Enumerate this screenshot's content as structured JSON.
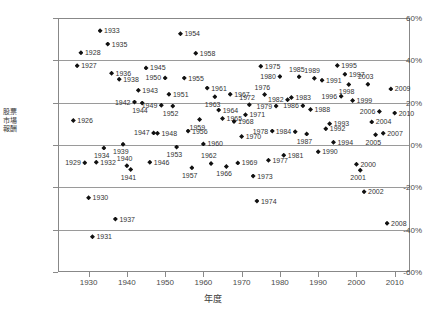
{
  "chart_data": {
    "type": "scatter",
    "title": "",
    "xlabel": "年度",
    "ylabel": "股票市場報酬",
    "xlim": [
      1922,
      2014
    ],
    "ylim": [
      -60,
      60
    ],
    "grid": true,
    "legend": "none",
    "xticks": [
      "1930",
      "1940",
      "1950",
      "1960",
      "1970",
      "1980",
      "1990",
      "2000",
      "2010"
    ],
    "xtick_values": [
      1930,
      1940,
      1950,
      1960,
      1970,
      1980,
      1990,
      2000,
      2010
    ],
    "yticks": [
      "60%",
      "40%",
      "20%",
      "0%",
      "-20%",
      "-40%",
      "-60%"
    ],
    "ytick_values": [
      60,
      40,
      20,
      0,
      -20,
      -40,
      -60
    ],
    "points": [
      {
        "label": "1926",
        "x": 1926,
        "y": 11.6,
        "pos": "r"
      },
      {
        "label": "1927",
        "x": 1927,
        "y": 37.5,
        "pos": "r"
      },
      {
        "label": "1928",
        "x": 1928,
        "y": 43.6,
        "pos": "r"
      },
      {
        "label": "1929",
        "x": 1929,
        "y": -8.4,
        "pos": "l"
      },
      {
        "label": "1930",
        "x": 1930,
        "y": -24.9,
        "pos": "r"
      },
      {
        "label": "1931",
        "x": 1931,
        "y": -43.3,
        "pos": "r"
      },
      {
        "label": "1932",
        "x": 1932,
        "y": -8.2,
        "pos": "r"
      },
      {
        "label": "1933",
        "x": 1933,
        "y": 54.0,
        "pos": "r"
      },
      {
        "label": "1934",
        "x": 1934,
        "y": -1.4,
        "pos": "b"
      },
      {
        "label": "1935",
        "x": 1935,
        "y": 47.7,
        "pos": "r"
      },
      {
        "label": "1936",
        "x": 1936,
        "y": 33.9,
        "pos": "r"
      },
      {
        "label": "1937",
        "x": 1937,
        "y": -35.0,
        "pos": "r"
      },
      {
        "label": "1938",
        "x": 1938,
        "y": 31.1,
        "pos": "r"
      },
      {
        "label": "1939",
        "x": 1939,
        "y": 0.4,
        "pos": "b"
      },
      {
        "label": "1940",
        "x": 1940,
        "y": -9.8,
        "pos": "t"
      },
      {
        "label": "1941",
        "x": 1941,
        "y": -11.6,
        "pos": "b"
      },
      {
        "label": "1942",
        "x": 1942,
        "y": 20.3,
        "pos": "l"
      },
      {
        "label": "1943",
        "x": 1943,
        "y": 25.9,
        "pos": "r"
      },
      {
        "label": "1944",
        "x": 1944,
        "y": 19.8,
        "pos": "b"
      },
      {
        "label": "1945",
        "x": 1945,
        "y": 36.4,
        "pos": "r"
      },
      {
        "label": "1946",
        "x": 1946,
        "y": -8.1,
        "pos": "r"
      },
      {
        "label": "1947",
        "x": 1947,
        "y": 5.7,
        "pos": "l"
      },
      {
        "label": "1948",
        "x": 1948,
        "y": 5.5,
        "pos": "r"
      },
      {
        "label": "1949",
        "x": 1949,
        "y": 18.8,
        "pos": "l"
      },
      {
        "label": "1950",
        "x": 1950,
        "y": 31.7,
        "pos": "l"
      },
      {
        "label": "1951",
        "x": 1951,
        "y": 24.0,
        "pos": "r"
      },
      {
        "label": "1952",
        "x": 1952,
        "y": 18.4,
        "pos": "b"
      },
      {
        "label": "1953",
        "x": 1953,
        "y": -1.0,
        "pos": "b"
      },
      {
        "label": "1954",
        "x": 1954,
        "y": 52.6,
        "pos": "r"
      },
      {
        "label": "1955",
        "x": 1955,
        "y": 31.6,
        "pos": "r"
      },
      {
        "label": "1956",
        "x": 1956,
        "y": 6.6,
        "pos": "r"
      },
      {
        "label": "1957",
        "x": 1957,
        "y": -10.8,
        "pos": "b"
      },
      {
        "label": "1958",
        "x": 1958,
        "y": 43.4,
        "pos": "r"
      },
      {
        "label": "1959",
        "x": 1959,
        "y": 12.0,
        "pos": "b"
      },
      {
        "label": "1960",
        "x": 1960,
        "y": 0.5,
        "pos": "r"
      },
      {
        "label": "1961",
        "x": 1961,
        "y": 26.9,
        "pos": "r"
      },
      {
        "label": "1962",
        "x": 1962,
        "y": -8.7,
        "pos": "t"
      },
      {
        "label": "1963",
        "x": 1963,
        "y": 22.8,
        "pos": "b"
      },
      {
        "label": "1964",
        "x": 1964,
        "y": 16.5,
        "pos": "r"
      },
      {
        "label": "1965",
        "x": 1965,
        "y": 12.5,
        "pos": "r"
      },
      {
        "label": "1966",
        "x": 1966,
        "y": -10.1,
        "pos": "b"
      },
      {
        "label": "1967",
        "x": 1967,
        "y": 24.0,
        "pos": "r"
      },
      {
        "label": "1968",
        "x": 1968,
        "y": 11.1,
        "pos": "r"
      },
      {
        "label": "1969",
        "x": 1969,
        "y": -8.5,
        "pos": "r"
      },
      {
        "label": "1970",
        "x": 1970,
        "y": 4.0,
        "pos": "r"
      },
      {
        "label": "1971",
        "x": 1971,
        "y": 14.3,
        "pos": "r"
      },
      {
        "label": "1972",
        "x": 1972,
        "y": 19.0,
        "pos": "t"
      },
      {
        "label": "1973",
        "x": 1973,
        "y": -14.7,
        "pos": "r"
      },
      {
        "label": "1974",
        "x": 1974,
        "y": -26.5,
        "pos": "r"
      },
      {
        "label": "1975",
        "x": 1975,
        "y": 37.2,
        "pos": "r"
      },
      {
        "label": "1976",
        "x": 1976,
        "y": 23.8,
        "pos": "t"
      },
      {
        "label": "1977",
        "x": 1977,
        "y": -7.2,
        "pos": "r"
      },
      {
        "label": "1978",
        "x": 1978,
        "y": 6.6,
        "pos": "l"
      },
      {
        "label": "1979",
        "x": 1979,
        "y": 18.4,
        "pos": "l"
      },
      {
        "label": "1980",
        "x": 1980,
        "y": 32.4,
        "pos": "l"
      },
      {
        "label": "1981",
        "x": 1981,
        "y": -4.9,
        "pos": "r"
      },
      {
        "label": "1982",
        "x": 1982,
        "y": 21.4,
        "pos": "l"
      },
      {
        "label": "1983",
        "x": 1983,
        "y": 22.5,
        "pos": "r"
      },
      {
        "label": "1984",
        "x": 1984,
        "y": 6.3,
        "pos": "l"
      },
      {
        "label": "1985",
        "x": 1985,
        "y": 32.2,
        "pos": "t"
      },
      {
        "label": "1986",
        "x": 1986,
        "y": 18.5,
        "pos": "l"
      },
      {
        "label": "1987",
        "x": 1987,
        "y": 5.2,
        "pos": "b"
      },
      {
        "label": "1988",
        "x": 1988,
        "y": 16.8,
        "pos": "r"
      },
      {
        "label": "1989",
        "x": 1989,
        "y": 31.5,
        "pos": "t"
      },
      {
        "label": "1990",
        "x": 1990,
        "y": -3.2,
        "pos": "r"
      },
      {
        "label": "1991",
        "x": 1991,
        "y": 30.6,
        "pos": "r"
      },
      {
        "label": "1992",
        "x": 1992,
        "y": 7.7,
        "pos": "r"
      },
      {
        "label": "1993",
        "x": 1993,
        "y": 10.0,
        "pos": "r"
      },
      {
        "label": "1994",
        "x": 1994,
        "y": 1.3,
        "pos": "r"
      },
      {
        "label": "1995",
        "x": 1995,
        "y": 37.6,
        "pos": "r"
      },
      {
        "label": "1996",
        "x": 1996,
        "y": 23.0,
        "pos": "l"
      },
      {
        "label": "1997",
        "x": 1997,
        "y": 33.4,
        "pos": "r"
      },
      {
        "label": "1998",
        "x": 1998,
        "y": 28.6,
        "pos": "b"
      },
      {
        "label": "1999",
        "x": 1999,
        "y": 21.0,
        "pos": "r"
      },
      {
        "label": "2000",
        "x": 2000,
        "y": -9.1,
        "pos": "r"
      },
      {
        "label": "2001",
        "x": 2001,
        "y": -11.9,
        "pos": "b"
      },
      {
        "label": "2002",
        "x": 2002,
        "y": -22.1,
        "pos": "r"
      },
      {
        "label": "2003",
        "x": 2003,
        "y": 28.7,
        "pos": "t"
      },
      {
        "label": "2004",
        "x": 2004,
        "y": 10.9,
        "pos": "r"
      },
      {
        "label": "2005",
        "x": 2005,
        "y": 4.9,
        "pos": "b"
      },
      {
        "label": "2006",
        "x": 2006,
        "y": 15.8,
        "pos": "l"
      },
      {
        "label": "2007",
        "x": 2007,
        "y": 5.5,
        "pos": "r"
      },
      {
        "label": "2008",
        "x": 2008,
        "y": -37.0,
        "pos": "r"
      },
      {
        "label": "2009",
        "x": 2009,
        "y": 26.5,
        "pos": "r"
      },
      {
        "label": "2010",
        "x": 2010,
        "y": 15.1,
        "pos": "r"
      }
    ]
  }
}
